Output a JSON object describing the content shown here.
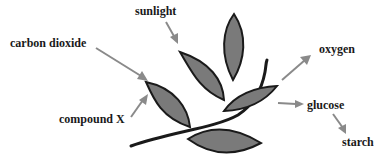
{
  "diagram": {
    "labels": {
      "sunlight": "sunlight",
      "carbon_dioxide": "carbon dioxide",
      "compound_x": "compound X",
      "oxygen": "oxygen",
      "glucose": "glucose",
      "starch": "starch"
    },
    "colors": {
      "leaf_fill": "#7a7a7a",
      "leaf_outline": "#1a1a1a",
      "arrow": "#8a8a8a",
      "text": "#1a1a1a"
    }
  }
}
